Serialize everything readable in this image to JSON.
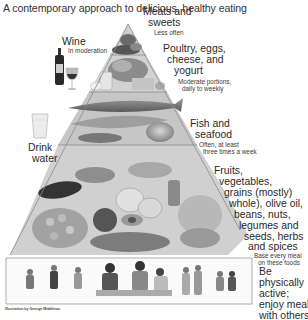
{
  "title": "A contemporary approach to delicious, healthy eating",
  "tiers": [
    {
      "id": "meats-sweets",
      "label_lines": [
        "Meats and",
        "sweets"
      ],
      "note": "Less often"
    },
    {
      "id": "poultry-eggs",
      "label_lines": [
        "Poultry, eggs,",
        "cheese, and",
        "yogurt"
      ],
      "note_lines": [
        "Moderate portions,",
        "daily to weekly"
      ]
    },
    {
      "id": "fish-seafood",
      "label_lines": [
        "Fish and",
        "seafood"
      ],
      "note_lines": [
        "Often, at least",
        "three times a week"
      ]
    },
    {
      "id": "plant-foods",
      "label_lines": [
        "Fruits,",
        "vegetables,",
        "grains (mostly)",
        "whole), olive oil,",
        "beans, nuts,",
        "legumes and",
        "seeds, herbs",
        "and spices"
      ],
      "note_lines": [
        "Base every meal",
        "on these foods"
      ]
    },
    {
      "id": "activity",
      "label_lines": [
        "Be",
        "physically",
        "active;",
        "enjoy meals",
        "with others"
      ]
    }
  ],
  "side_items": {
    "wine": {
      "label": "Wine",
      "note": "In moderation"
    },
    "water": {
      "label_lines": [
        "Drink",
        "water"
      ]
    }
  },
  "credit": "Illustration by George Middleton",
  "colors": {
    "line": "#8a8a8a",
    "text": "#2a2a2a",
    "background": "#ffffff"
  }
}
